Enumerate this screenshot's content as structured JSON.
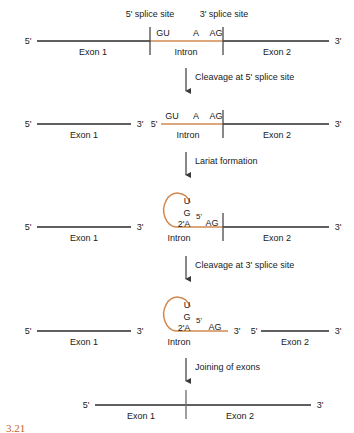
{
  "figure": {
    "caption_partial": "3.21",
    "colors": {
      "exon_line": "#2b2b2b",
      "intron_line": "#d08a4f",
      "lariat_loop": "#d08a4f",
      "text": "#1a1a1a",
      "arrow": "#3a3a3a",
      "caption": "#c0662a",
      "background": "#ffffff"
    }
  },
  "annotations": {
    "five_splice_site": "5' splice site",
    "three_splice_site": "3' splice site"
  },
  "nucleotides": {
    "gu": "GU",
    "a": "A",
    "ag": "AG",
    "u": "U",
    "g": "G",
    "branch_a": "2'A",
    "five_prime_branch": "5'"
  },
  "ends": {
    "five": "5'",
    "three": "3'"
  },
  "segments": {
    "exon1": "Exon 1",
    "exon2": "Exon 2",
    "intron": "Intron"
  },
  "steps": [
    {
      "id": "step-1",
      "label": "Cleavage at 5' splice site"
    },
    {
      "id": "step-2",
      "label": "Lariat formation"
    },
    {
      "id": "step-3",
      "label": "Cleavage at 3' splice site"
    },
    {
      "id": "step-4",
      "label": "Joining of exons"
    }
  ],
  "rows": [
    {
      "id": "row-1",
      "description": "Intact pre-mRNA with Exon 1, Intron, Exon 2"
    },
    {
      "id": "row-2",
      "description": "After cleavage at 5' splice site: free Exon 1, intron still joined to Exon 2"
    },
    {
      "id": "row-3",
      "description": "Lariat formed at branch point A"
    },
    {
      "id": "row-4",
      "description": "After cleavage at 3' splice site: lariat intron released, Exon 2 free"
    },
    {
      "id": "row-5",
      "description": "Exons joined: mature mRNA"
    }
  ]
}
